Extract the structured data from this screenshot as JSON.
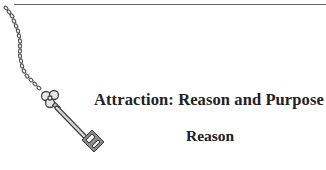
{
  "document": {
    "heading": "Attraction: Reason and Purpose",
    "subheading": "Reason"
  },
  "decoration": {
    "icon": "key-on-chain-icon",
    "rule_color": "#6a6a6a"
  }
}
